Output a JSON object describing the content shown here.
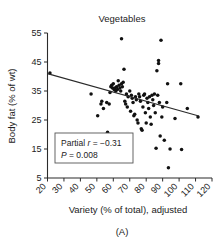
{
  "chart_data": {
    "type": "scatter",
    "title": "Vegetables",
    "xlabel": "Variety (% of total), adjusted",
    "ylabel": "Body fat (% of wt)",
    "panel_label": "(A)",
    "xlim": [
      20,
      120
    ],
    "ylim": [
      5,
      55
    ],
    "xticks": [
      20,
      30,
      40,
      50,
      60,
      70,
      80,
      90,
      100,
      110,
      120
    ],
    "yticks": [
      5,
      15,
      25,
      35,
      45,
      55
    ],
    "xtick_labels": [
      "20",
      "30",
      "40",
      "50",
      "60",
      "70",
      "80",
      "90",
      "100",
      "110",
      "120"
    ],
    "ytick_labels": [
      "5",
      "15",
      "25",
      "35",
      "45",
      "55"
    ],
    "xtick_rotation_deg": 45,
    "grid": false,
    "legend": false,
    "marker": "filled-circle",
    "marker_color": "#111111",
    "trendline": {
      "name": "linear fit",
      "x_start": 20.0,
      "y_start": 41.0,
      "x_end": 112.0,
      "y_end": 26.4,
      "color": "#2b2b2b"
    },
    "annotation": {
      "line1_prefix": "Partial ",
      "line1_stat": "r",
      "line1_value": " = −0.31",
      "line2_stat": "P",
      "line2_value": " = 0.008",
      "full_text": "Partial r = −0.31; P = 0.008",
      "boxed": true
    },
    "points": [
      [
        21.5,
        41.2
      ],
      [
        46.5,
        34.0
      ],
      [
        50.5,
        26.5
      ],
      [
        52.5,
        30.5
      ],
      [
        53.0,
        31.5
      ],
      [
        54.0,
        29.0
      ],
      [
        56.0,
        31.0
      ],
      [
        56.5,
        20.8
      ],
      [
        57.5,
        30.5
      ],
      [
        58.0,
        34.5
      ],
      [
        58.5,
        36.5
      ],
      [
        59.0,
        37.0
      ],
      [
        59.5,
        36.0
      ],
      [
        60.0,
        37.5
      ],
      [
        60.5,
        35.5
      ],
      [
        61.0,
        36.0
      ],
      [
        61.5,
        35.0
      ],
      [
        62.0,
        36.5
      ],
      [
        62.5,
        35.5
      ],
      [
        63.0,
        38.5
      ],
      [
        63.5,
        37.0
      ],
      [
        64.0,
        36.0
      ],
      [
        64.5,
        35.0
      ],
      [
        65.0,
        53.0
      ],
      [
        65.0,
        37.5
      ],
      [
        65.5,
        36.5
      ],
      [
        66.0,
        38.0
      ],
      [
        66.5,
        42.5
      ],
      [
        67.0,
        31.5
      ],
      [
        67.5,
        30.5
      ],
      [
        68.0,
        34.0
      ],
      [
        68.5,
        29.5
      ],
      [
        69.0,
        33.0
      ],
      [
        70.0,
        35.0
      ],
      [
        70.5,
        28.0
      ],
      [
        71.0,
        33.5
      ],
      [
        71.5,
        32.5
      ],
      [
        72.0,
        31.0
      ],
      [
        72.5,
        26.5
      ],
      [
        73.0,
        27.0
      ],
      [
        73.5,
        33.0
      ],
      [
        74.0,
        32.0
      ],
      [
        74.5,
        25.0
      ],
      [
        75.0,
        24.0
      ],
      [
        75.5,
        34.0
      ],
      [
        76.0,
        33.0
      ],
      [
        76.5,
        31.5
      ],
      [
        77.0,
        22.0
      ],
      [
        77.5,
        21.5
      ],
      [
        78.0,
        29.5
      ],
      [
        78.5,
        33.5
      ],
      [
        79.0,
        34.0
      ],
      [
        79.5,
        27.5
      ],
      [
        80.0,
        24.0
      ],
      [
        80.5,
        32.5
      ],
      [
        81.0,
        31.0
      ],
      [
        81.5,
        29.0
      ],
      [
        82.0,
        33.0
      ],
      [
        82.5,
        26.0
      ],
      [
        83.0,
        23.5
      ],
      [
        83.5,
        33.5
      ],
      [
        84.0,
        32.0
      ],
      [
        84.5,
        30.0
      ],
      [
        85.0,
        34.0
      ],
      [
        85.5,
        27.5
      ],
      [
        86.0,
        15.3
      ],
      [
        86.5,
        42.0
      ],
      [
        87.0,
        33.5
      ],
      [
        87.5,
        44.5
      ],
      [
        87.5,
        45.5
      ],
      [
        88.0,
        31.0
      ],
      [
        88.5,
        19.5
      ],
      [
        89.0,
        52.5
      ],
      [
        89.5,
        26.0
      ],
      [
        90.0,
        29.5
      ],
      [
        91.0,
        18.0
      ],
      [
        92.5,
        31.0
      ],
      [
        93.0,
        37.5
      ],
      [
        93.5,
        8.5
      ],
      [
        94.5,
        15.0
      ],
      [
        97.5,
        25.5
      ],
      [
        101.0,
        37.5
      ],
      [
        101.5,
        14.8
      ],
      [
        105.0,
        29.0
      ],
      [
        111.5,
        26.0
      ]
    ]
  }
}
